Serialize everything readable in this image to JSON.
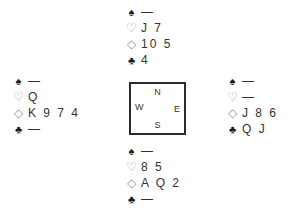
{
  "suits": {
    "spade": "♠",
    "heart": "♡",
    "diamond": "◇",
    "club": "♣"
  },
  "hands": {
    "north": {
      "spades": "—",
      "hearts": "J 7",
      "diamonds": "10 5",
      "clubs": "4"
    },
    "west": {
      "spades": "—",
      "hearts": "Q",
      "diamonds": "K 9 7 4",
      "clubs": "—"
    },
    "east": {
      "spades": "—",
      "hearts": "—",
      "diamonds": "J 8 6",
      "clubs": "Q J"
    },
    "south": {
      "spades": "—",
      "hearts": "8 5",
      "diamonds": "A Q 2",
      "clubs": "—"
    }
  },
  "compass": {
    "north": "N",
    "south": "S",
    "east": "E",
    "west": "W"
  }
}
